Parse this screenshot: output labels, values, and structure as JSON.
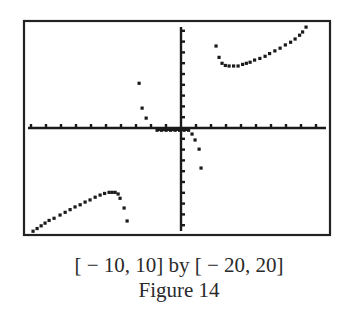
{
  "chart_data": {
    "type": "scatter",
    "title": "",
    "xlabel": "",
    "ylabel": "",
    "xlim": [
      -10,
      10
    ],
    "ylim": [
      -20,
      20
    ],
    "x_tick_step": 1,
    "y_tick_step": 2,
    "grid": false,
    "legend": null,
    "colors": {
      "ink": "#1a1a1a",
      "frame": "#222222",
      "background": "#ffffff"
    },
    "series": [
      {
        "name": "upper-right branch",
        "points": [
          [
            2.33,
            15.2
          ],
          [
            2.53,
            13.1
          ],
          [
            2.73,
            12.0
          ],
          [
            2.95,
            11.6
          ],
          [
            3.2,
            11.5
          ],
          [
            3.5,
            11.5
          ],
          [
            3.8,
            11.5
          ],
          [
            4.1,
            11.8
          ],
          [
            4.35,
            12.0
          ],
          [
            4.6,
            12.2
          ],
          [
            4.9,
            12.6
          ],
          [
            5.25,
            12.9
          ],
          [
            5.6,
            13.3
          ],
          [
            5.9,
            13.8
          ],
          [
            6.25,
            14.3
          ],
          [
            6.6,
            14.8
          ],
          [
            6.95,
            15.4
          ],
          [
            7.3,
            15.9
          ],
          [
            7.6,
            16.5
          ],
          [
            7.9,
            17.2
          ],
          [
            8.1,
            17.8
          ],
          [
            8.33,
            18.7
          ]
        ]
      },
      {
        "name": "lower-left branch",
        "points": [
          [
            -9.87,
            -19.1
          ],
          [
            -9.6,
            -18.6
          ],
          [
            -9.33,
            -18.1
          ],
          [
            -9.07,
            -17.6
          ],
          [
            -8.8,
            -17.1
          ],
          [
            -8.47,
            -16.7
          ],
          [
            -8.07,
            -16.1
          ],
          [
            -7.73,
            -15.6
          ],
          [
            -7.4,
            -15.1
          ],
          [
            -7.07,
            -14.6
          ],
          [
            -6.73,
            -14.2
          ],
          [
            -6.4,
            -13.7
          ],
          [
            -6.07,
            -13.3
          ],
          [
            -5.73,
            -12.8
          ],
          [
            -5.4,
            -12.4
          ],
          [
            -5.1,
            -12.1
          ],
          [
            -4.8,
            -11.9
          ],
          [
            -4.6,
            -11.9
          ],
          [
            -4.4,
            -11.9
          ],
          [
            -4.2,
            -12.2
          ],
          [
            -4.07,
            -13.0
          ],
          [
            -3.8,
            -14.8
          ],
          [
            -3.6,
            -17.2
          ]
        ]
      },
      {
        "name": "middle branch",
        "points": [
          [
            -2.8,
            8.3
          ],
          [
            -2.6,
            3.7
          ],
          [
            -2.33,
            1.85
          ],
          [
            -1.6,
            -0.4
          ],
          [
            -1.3,
            -0.4
          ],
          [
            -1.0,
            -0.4
          ],
          [
            -0.7,
            -0.4
          ],
          [
            -0.4,
            -0.4
          ],
          [
            -0.1,
            -0.4
          ],
          [
            0.2,
            -0.4
          ],
          [
            0.5,
            -0.4
          ],
          [
            0.73,
            -1.1
          ],
          [
            0.93,
            -2.2
          ],
          [
            1.2,
            -3.9
          ],
          [
            1.33,
            -7.4
          ]
        ]
      }
    ],
    "annotations": [
      "[ − 10, 10] by [ − 20, 20]",
      "Figure 14"
    ]
  },
  "caption": {
    "window": "[ − 10, 10] by [ − 20, 20]",
    "figure": "Figure 14"
  }
}
